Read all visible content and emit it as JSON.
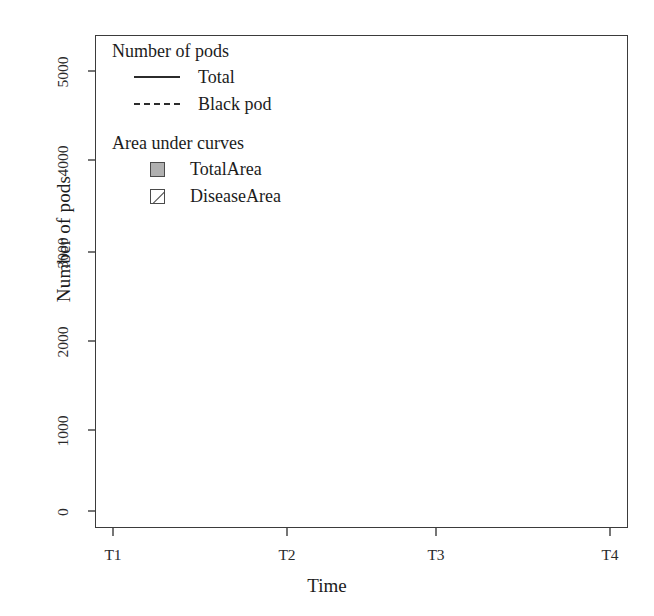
{
  "chart_data": {
    "type": "area",
    "title": "",
    "xlabel": "Time",
    "ylabel": "Number of pods",
    "categories": [
      "T1",
      "T2",
      "T3",
      "T4"
    ],
    "x": [
      1,
      2,
      3,
      4
    ],
    "xlim": [
      0.82,
      4.18
    ],
    "ylim": [
      -150,
      5350
    ],
    "yticks": [
      0,
      1000,
      2000,
      3000,
      4000,
      5000
    ],
    "ytick_labels": [
      "0",
      "1000",
      "2000",
      "3000",
      "4000",
      "5000"
    ],
    "xtick_labels": [
      "T1",
      "T2",
      "T3",
      "T4"
    ],
    "grid": false,
    "legend_position": "top-left",
    "series": [
      {
        "name": "Total",
        "style": "solid",
        "color": "#2b2b2b",
        "values": [
          50,
          500,
          4500,
          450
        ]
      },
      {
        "name": "Black pod",
        "style": "dashed",
        "color": "#2b2b2b",
        "values": [
          30,
          60,
          100,
          100
        ]
      }
    ],
    "areas": [
      {
        "name": "TotalArea",
        "fill": "solid-gray",
        "color": "#b0b0b0",
        "upper_series": "Total",
        "lower_series": "Black pod"
      },
      {
        "name": "DiseaseArea",
        "fill": "diagonal-hatch",
        "color": "#ffffff",
        "upper_series": "Black pod",
        "lower_series": "baseline"
      }
    ],
    "annotations": []
  },
  "legend": {
    "group_one_title": "Number of pods",
    "group_two_title": "Area under curves",
    "entries": [
      {
        "label": "Total",
        "key": "solid-line-key"
      },
      {
        "label": "Black pod",
        "key": "dashed-line-key"
      },
      {
        "label": "TotalArea",
        "key": "filled-square-key"
      },
      {
        "label": "DiseaseArea",
        "key": "hatched-square-key"
      }
    ]
  },
  "colors": {
    "area_fill": "#b0b0b0",
    "line": "#2b2b2b",
    "frame": "#3b3b3b",
    "background": "#ffffff"
  }
}
